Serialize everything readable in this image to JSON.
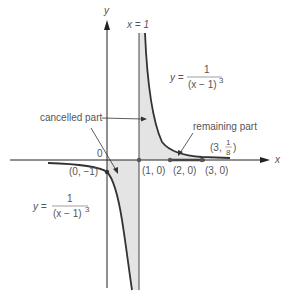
{
  "axes": {
    "x_label": "x",
    "y_label": "y",
    "origin_label": "0"
  },
  "asymptote": {
    "label": "x = 1"
  },
  "curves": {
    "upper": {
      "lhs": "y =",
      "numerator": "1",
      "denominator": "(x − 1)",
      "exponent": "3"
    },
    "lower": {
      "lhs": "y =",
      "numerator": "1",
      "denominator": "(x − 1)",
      "exponent": "3"
    }
  },
  "annotations": {
    "cancelled": "cancelled part",
    "remaining": "remaining part"
  },
  "points": {
    "p_0_m1": "(0, −1)",
    "p_1_0": "(1, 0)",
    "p_2_0": "(2, 0)",
    "p_3_0": "(3, 0)",
    "p_3_eighth_prefix": "(3,",
    "p_3_eighth_num": "1",
    "p_3_eighth_den": "8",
    "p_3_eighth_suffix": ")"
  },
  "colors": {
    "curve": "#333333",
    "axis": "#222222",
    "shade": "#e4e4e4",
    "text": "#555555"
  }
}
